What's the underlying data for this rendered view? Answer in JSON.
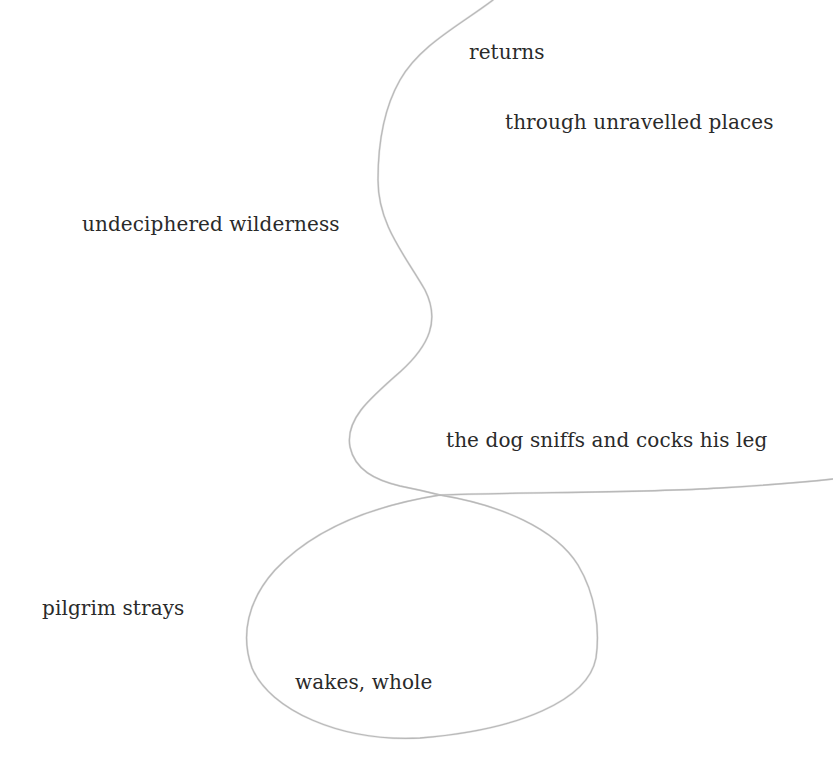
{
  "poem": {
    "fragments": [
      {
        "id": "returns",
        "text": "returns"
      },
      {
        "id": "through",
        "text": "through unravelled places"
      },
      {
        "id": "undeciphered",
        "text": "undeciphered wilderness"
      },
      {
        "id": "dog",
        "text": "the dog sniffs and cocks his leg"
      },
      {
        "id": "pilgrim",
        "text": "pilgrim strays"
      },
      {
        "id": "wakes",
        "text": "wakes, whole"
      }
    ]
  },
  "drawing": {
    "line_color": "#b9b9b9",
    "text_color": "#2a2a2a",
    "background": "#ffffff"
  }
}
